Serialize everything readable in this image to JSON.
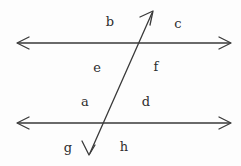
{
  "figure": {
    "background_color": "#fdfdfd",
    "stroke_color": "#3a3a3a",
    "label_color": "#2e2e2e",
    "stroke_width": 1.3,
    "width": 241,
    "height": 166,
    "lines": [
      {
        "name": "upper-parallel-line",
        "kind": "double-headed-arrow",
        "x1": 16,
        "y1": 43,
        "x2": 232,
        "y2": 43
      },
      {
        "name": "lower-parallel-line",
        "kind": "double-headed-arrow",
        "x1": 16,
        "y1": 123,
        "x2": 232,
        "y2": 123
      },
      {
        "name": "transversal-line",
        "kind": "double-headed-arrow",
        "x1": 89,
        "y1": 155,
        "x2": 153,
        "y2": 11
      }
    ],
    "intersections": [
      {
        "name": "upper-intersection",
        "x": 138,
        "y": 43
      },
      {
        "name": "lower-intersection",
        "x": 101,
        "y": 123
      }
    ],
    "labels": [
      {
        "name": "angle-label-b",
        "text": "b",
        "x": 110,
        "y": 21
      },
      {
        "name": "angle-label-c",
        "text": "c",
        "x": 178,
        "y": 23
      },
      {
        "name": "angle-label-e",
        "text": "e",
        "x": 97,
        "y": 67
      },
      {
        "name": "angle-label-f",
        "text": "f",
        "x": 156,
        "y": 66
      },
      {
        "name": "angle-label-a",
        "text": "a",
        "x": 85,
        "y": 101
      },
      {
        "name": "angle-label-d",
        "text": "d",
        "x": 146,
        "y": 101
      },
      {
        "name": "angle-label-g",
        "text": "g",
        "x": 68,
        "y": 147
      },
      {
        "name": "angle-label-h",
        "text": "h",
        "x": 124,
        "y": 146
      }
    ]
  }
}
